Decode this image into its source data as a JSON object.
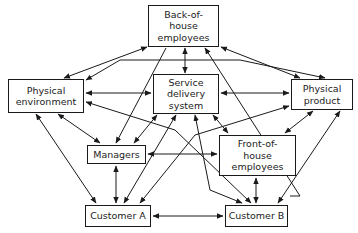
{
  "diagram": {
    "type": "relationship-network",
    "nodes": [
      {
        "id": "boh",
        "label": "Back-of-\nhouse\nemployees",
        "x": 148,
        "y": 5,
        "w": 71,
        "h": 42
      },
      {
        "id": "penv",
        "label": "Physical\nenvironment",
        "x": 8,
        "y": 79,
        "w": 76,
        "h": 34
      },
      {
        "id": "sds",
        "label": "Service\ndelivery\nsystem",
        "x": 153,
        "y": 74,
        "w": 66,
        "h": 40
      },
      {
        "id": "pprod",
        "label": "Physical\nproduct",
        "x": 291,
        "y": 79,
        "w": 62,
        "h": 31
      },
      {
        "id": "mgr",
        "label": "Managers",
        "x": 87,
        "y": 145,
        "w": 59,
        "h": 19
      },
      {
        "id": "foh",
        "label": "Front-of-\nhouse\nemployees",
        "x": 219,
        "y": 135,
        "w": 77,
        "h": 41
      },
      {
        "id": "custA",
        "label": "Customer A",
        "x": 85,
        "y": 205,
        "w": 66,
        "h": 22
      },
      {
        "id": "custB",
        "label": "Customer B",
        "x": 225,
        "y": 205,
        "w": 63,
        "h": 22
      }
    ],
    "edges": [
      {
        "from": "boh",
        "to": "penv",
        "style": "double-arrow"
      },
      {
        "from": "boh",
        "to": "sds",
        "style": "double-arrow"
      },
      {
        "from": "boh",
        "to": "pprod",
        "style": "double-arrow"
      },
      {
        "from": "boh",
        "to": "custA",
        "style": "single-arrow-to-boh"
      },
      {
        "from": "boh",
        "to": "custB",
        "style": "single-arrow-to-custB"
      },
      {
        "from": "penv",
        "to": "sds",
        "style": "double-arrow"
      },
      {
        "from": "penv",
        "to": "pprod",
        "style": "bent-double-arrow"
      },
      {
        "from": "penv",
        "to": "mgr",
        "style": "double-arrow"
      },
      {
        "from": "penv",
        "to": "custA",
        "style": "double-arrow"
      },
      {
        "from": "penv",
        "to": "custB",
        "style": "double-arrow"
      },
      {
        "from": "sds",
        "to": "pprod",
        "style": "double-arrow"
      },
      {
        "from": "sds",
        "to": "mgr",
        "style": "double-arrow"
      },
      {
        "from": "sds",
        "to": "foh",
        "style": "double-arrow"
      },
      {
        "from": "sds",
        "to": "custA",
        "style": "double-arrow"
      },
      {
        "from": "sds",
        "to": "custB",
        "style": "double-arrow"
      },
      {
        "from": "pprod",
        "to": "foh",
        "style": "double-arrow"
      },
      {
        "from": "pprod",
        "to": "custB",
        "style": "double-arrow"
      },
      {
        "from": "pprod",
        "to": "custA",
        "style": "bent-double-arrow"
      },
      {
        "from": "mgr",
        "to": "foh",
        "style": "double-arrow"
      },
      {
        "from": "mgr",
        "to": "custA",
        "style": "double-arrow"
      },
      {
        "from": "foh",
        "to": "custB",
        "style": "double-arrow"
      },
      {
        "from": "custA",
        "to": "custB",
        "style": "double-arrow"
      },
      {
        "from": "mgr",
        "to": "boh",
        "style": "single-arrow-to-mgr"
      }
    ]
  },
  "labels": {
    "boh": "Back-of-\nhouse\nemployees",
    "penv": "Physical\nenvironment",
    "sds": "Service\ndelivery\nsystem",
    "pprod": "Physical\nproduct",
    "mgr": "Managers",
    "foh": "Front-of-\nhouse\nemployees",
    "custA": "Customer A",
    "custB": "Customer B"
  },
  "colors": {
    "line": "#1a1a1a",
    "background": "#ffffff",
    "text": "#222222"
  }
}
